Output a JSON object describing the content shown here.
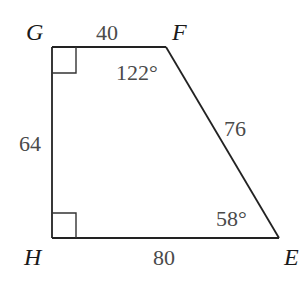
{
  "figure": {
    "type": "trapezoid",
    "vertices": {
      "G": {
        "label": "G",
        "x": 52,
        "y": 47
      },
      "F": {
        "label": "F",
        "x": 166,
        "y": 47
      },
      "E": {
        "label": "E",
        "x": 279,
        "y": 238
      },
      "H": {
        "label": "H",
        "x": 52,
        "y": 238
      }
    },
    "sides": {
      "GF": "40",
      "FE": "76",
      "HE": "80",
      "GH": "64"
    },
    "angles": {
      "F": "122°",
      "E": "58°",
      "G": "right angle",
      "H": "right angle"
    },
    "colors": {
      "stroke": "#222222",
      "vertex_text": "#1a1a1a",
      "measure_text": "#4a4a4a",
      "background": "#ffffff"
    }
  }
}
